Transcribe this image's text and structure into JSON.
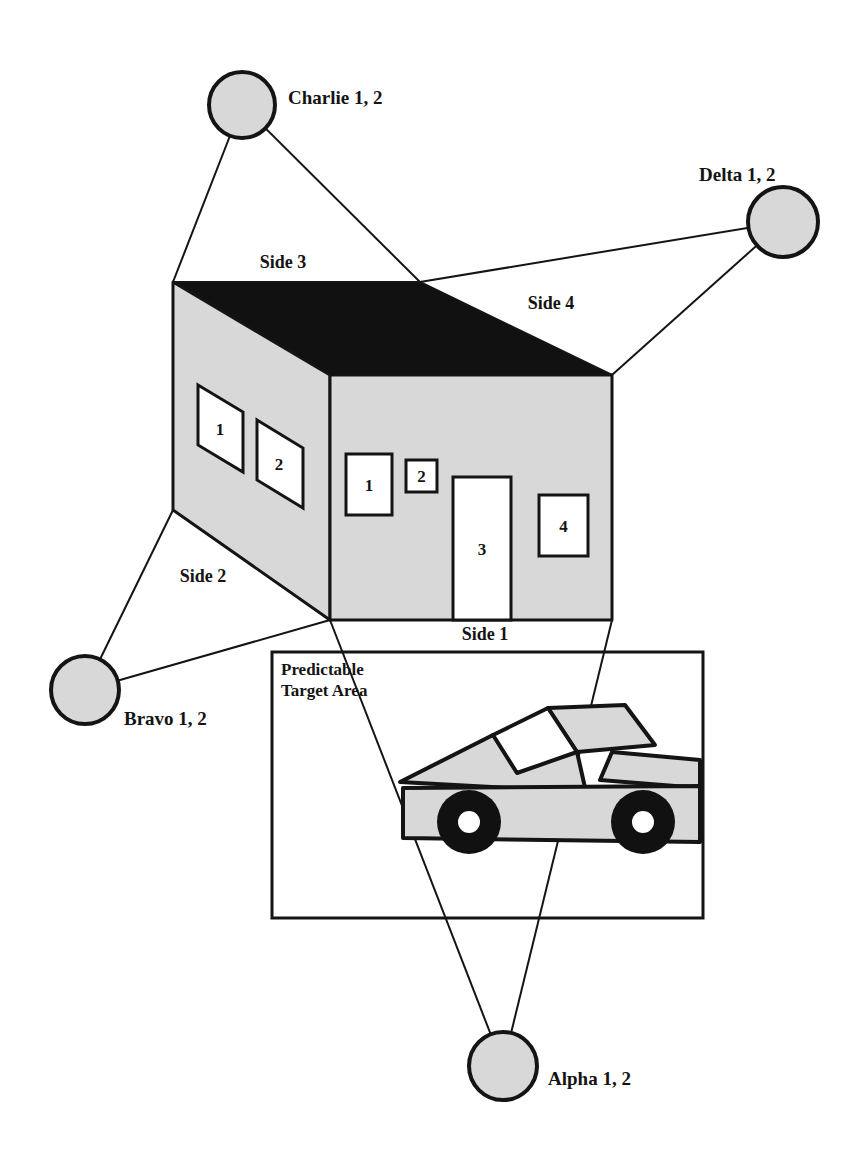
{
  "diagram": {
    "colors": {
      "line": "#141414",
      "wall_fill": "#d8d8d8",
      "roof_fill": "#111111",
      "circle_fill": "#d8d8d8",
      "opening_fill": "#ffffff",
      "background": "#ffffff",
      "wheel": "#111111"
    },
    "stations": [
      {
        "id": "charlie",
        "label": "Charlie 1, 2",
        "cx": 242,
        "cy": 105,
        "r": 33,
        "label_x": 288,
        "label_y": 104
      },
      {
        "id": "delta",
        "label": "Delta 1, 2",
        "cx": 783,
        "cy": 222,
        "r": 35,
        "label_x": 699,
        "label_y": 181
      },
      {
        "id": "bravo",
        "label": "Bravo 1, 2",
        "cx": 85,
        "cy": 690,
        "r": 34,
        "label_x": 124,
        "label_y": 725
      },
      {
        "id": "alpha",
        "label": "Alpha 1, 2",
        "cx": 503,
        "cy": 1066,
        "r": 34,
        "label_x": 548,
        "label_y": 1085
      }
    ],
    "sides": [
      {
        "id": "side1",
        "label": "Side 1",
        "x": 485,
        "y": 640
      },
      {
        "id": "side2",
        "label": "Side 2",
        "x": 203,
        "y": 582
      },
      {
        "id": "side3",
        "label": "Side 3",
        "x": 283,
        "y": 268
      },
      {
        "id": "side4",
        "label": "Side 4",
        "x": 551,
        "y": 309
      }
    ],
    "building": {
      "front_face_points": "330,375 612,375 612,620 330,620",
      "left_face_points": "173,282 330,375 330,620 173,510",
      "roof_points": "173,282 420,282 612,375 330,375",
      "front_openings": [
        {
          "id": "window-1",
          "num": "1",
          "x": 346,
          "y": 454,
          "w": 46,
          "h": 61
        },
        {
          "id": "window-2",
          "num": "2",
          "x": 406,
          "y": 460,
          "w": 31,
          "h": 32
        },
        {
          "id": "door-3",
          "num": "3",
          "x": 453,
          "y": 477,
          "w": 58,
          "h": 143
        },
        {
          "id": "window-4",
          "num": "4",
          "x": 539,
          "y": 495,
          "w": 49,
          "h": 61
        }
      ],
      "left_openings": [
        {
          "id": "window-1-left",
          "num": "1",
          "points": "198,385 243,412 243,472 198,445",
          "tx": 220,
          "ty": 435
        },
        {
          "id": "window-2-left",
          "num": "2",
          "points": "257,420 303,448 303,508 257,480",
          "tx": 279,
          "ty": 470
        }
      ]
    },
    "target_area": {
      "label_line1": "Predictable",
      "label_line2": "Target Area",
      "label_x": 281,
      "label_y1": 675,
      "label_y2": 696,
      "x": 272,
      "y": 652,
      "w": 431,
      "h": 266
    },
    "sight_lines": [
      {
        "id": "charlie-left",
        "x1": 242,
        "y1": 105,
        "x2": 173,
        "y2": 282
      },
      {
        "id": "charlie-right",
        "x1": 242,
        "y1": 105,
        "x2": 420,
        "y2": 282
      },
      {
        "id": "delta-left",
        "x1": 783,
        "y1": 222,
        "x2": 420,
        "y2": 282
      },
      {
        "id": "delta-right",
        "x1": 783,
        "y1": 222,
        "x2": 612,
        "y2": 375
      },
      {
        "id": "bravo-top",
        "x1": 85,
        "y1": 690,
        "x2": 173,
        "y2": 510
      },
      {
        "id": "bravo-bottom",
        "x1": 85,
        "y1": 690,
        "x2": 330,
        "y2": 620
      },
      {
        "id": "alpha-left",
        "x1": 503,
        "y1": 1066,
        "x2": 330,
        "y2": 620
      },
      {
        "id": "alpha-right",
        "x1": 503,
        "y1": 1066,
        "x2": 612,
        "y2": 620
      }
    ],
    "vehicle": {
      "id": "pickup-truck",
      "bed_side_points": "405,785 405,835 515,855 700,840 700,790 600,780",
      "body_points": "403,788 403,838 700,842 700,786",
      "cab_roof_points": "548,708 625,705 655,745 577,752",
      "cab_windshield_points": "493,735 548,708 577,752 517,773",
      "hood_points": "400,782 493,735 577,752 586,792",
      "bed_rail_points": "600,780 700,788 700,760 612,752",
      "wheels": [
        {
          "id": "front-wheel",
          "cx": 469,
          "cy": 822,
          "r": 32,
          "hub_r": 11
        },
        {
          "id": "rear-wheel",
          "cx": 643,
          "cy": 822,
          "r": 32,
          "hub_r": 11
        }
      ]
    }
  }
}
